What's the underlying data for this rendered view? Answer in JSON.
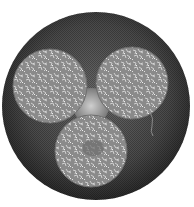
{
  "image": {
    "description": "Grayscale micrograph: large dark circular cross-section containing three lighter textured circular sub-sections arranged in a triangle",
    "background_color": "#ffffff",
    "outer_circle": {
      "cx": 96,
      "cy": 106,
      "r": 94,
      "color": "#3a3a3a"
    },
    "center_gap_color": "#b8b8b8",
    "inner_circles": [
      {
        "name": "top-left",
        "cx": 50,
        "cy": 86,
        "r": 37,
        "color": "#8a8a8a"
      },
      {
        "name": "top-right",
        "cx": 132,
        "cy": 83,
        "r": 36,
        "color": "#8a8a8a"
      },
      {
        "name": "bottom",
        "cx": 91,
        "cy": 151,
        "r": 36,
        "color": "#858585"
      }
    ]
  }
}
